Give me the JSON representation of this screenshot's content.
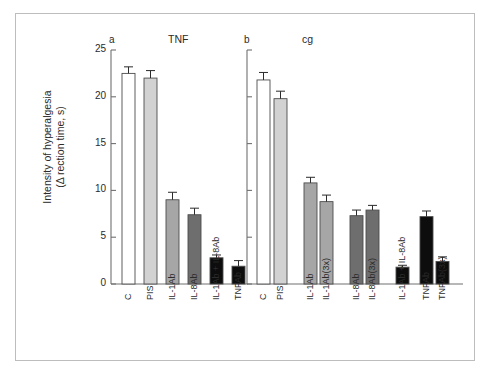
{
  "figure": {
    "background": "#ffffff",
    "frame_color": "#bdbdbd"
  },
  "axis": {
    "y_label_line1": "Intensity of hyperalgesia",
    "y_label_line2": "(Δ rection time, s)",
    "y_ticks": [
      "0",
      "5",
      "10",
      "15",
      "20",
      "25"
    ],
    "y_min": 0,
    "y_max": 25
  },
  "panels": {
    "left": {
      "id": "a",
      "title": "TNF"
    },
    "right": {
      "id": "b",
      "title": "cg"
    }
  },
  "colors": {
    "white": "#ffffff",
    "light_gray": "#d2d2d2",
    "mid_gray": "#a6a6a6",
    "dark_gray": "#6e6e6e",
    "black": "#0d0d0d",
    "outline": "#4d4d4d",
    "error_bar": "#2b2b2b"
  },
  "chart_data": {
    "type": "bar",
    "title": "",
    "xlabel": "",
    "ylabel": "Intensity of hyperalgesia (Δ rection time, s)",
    "ylim": [
      0,
      25
    ],
    "grid": false,
    "legend": "none",
    "panels": [
      {
        "panel_id": "a",
        "panel_title": "TNF",
        "categories": [
          "C",
          "PIS",
          "IL-1Ab",
          "IL-8Ab",
          "IL-1Ab + IL-8Ab",
          "TNFAb"
        ],
        "values": [
          22.5,
          22.0,
          9.0,
          7.4,
          2.8,
          1.9
        ],
        "errors": [
          0.7,
          0.8,
          0.8,
          0.7,
          0.3,
          0.6
        ],
        "fills": [
          "white",
          "light_gray",
          "mid_gray",
          "dark_gray",
          "black",
          "black"
        ]
      },
      {
        "panel_id": "b",
        "panel_title": "cg",
        "categories": [
          "C",
          "PIS",
          "IL-1Ab",
          "IL-1Ab(3x)",
          "IL-8Ab",
          "IL-8Ab(3x)",
          "IL-1Ab + IL-8Ab",
          "TNFAb",
          "TNFAb(3x)"
        ],
        "values": [
          21.8,
          19.8,
          10.8,
          8.8,
          7.3,
          7.9,
          1.8,
          7.2,
          2.4
        ],
        "errors": [
          0.8,
          0.8,
          0.6,
          0.7,
          0.6,
          0.5,
          0.2,
          0.6,
          0.5
        ],
        "fills": [
          "white",
          "light_gray",
          "mid_gray",
          "mid_gray",
          "dark_gray",
          "dark_gray",
          "black",
          "black",
          "black"
        ]
      }
    ]
  }
}
